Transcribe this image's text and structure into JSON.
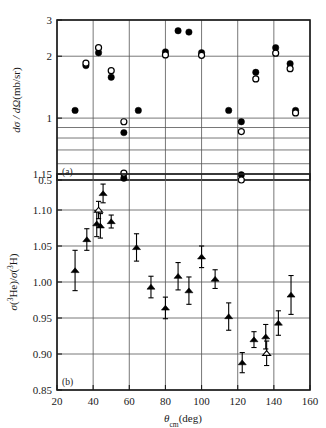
{
  "figure": {
    "background": "#ffffff",
    "ink": "#1a1a1a"
  },
  "chart_data": [
    {
      "type": "scatter",
      "panel_label": "(a)",
      "title": "",
      "xlabel": "",
      "ylabel": "dσ / dΩ(mb/sr)",
      "yscale": "log",
      "ylim": [
        0.5,
        3
      ],
      "xlim": [
        20,
        160
      ],
      "ytick_labels": [
        "3",
        "2",
        "1",
        "0.5"
      ],
      "ytick_values": [
        3,
        2,
        1,
        0.5
      ],
      "ygrid_values": [
        3,
        2,
        1,
        0.9,
        0.8,
        0.7,
        0.6,
        0.5
      ],
      "xgrid_values": [
        20,
        40,
        60,
        80,
        100,
        120,
        140,
        160
      ],
      "grid": true,
      "legend": "",
      "series": [
        {
          "name": "σ(3He) filled circles",
          "marker": "filled-circle",
          "points": [
            {
              "x": 30,
              "y": 1.09
            },
            {
              "x": 36,
              "y": 1.8
            },
            {
              "x": 43,
              "y": 2.08
            },
            {
              "x": 50,
              "y": 1.58
            },
            {
              "x": 57,
              "y": 0.85
            },
            {
              "x": 57,
              "y": 0.51
            },
            {
              "x": 65,
              "y": 1.09
            },
            {
              "x": 80,
              "y": 2.1
            },
            {
              "x": 87,
              "y": 2.66
            },
            {
              "x": 93,
              "y": 2.62
            },
            {
              "x": 100,
              "y": 2.08
            },
            {
              "x": 115,
              "y": 1.09
            },
            {
              "x": 122,
              "y": 0.96
            },
            {
              "x": 122,
              "y": 0.53
            },
            {
              "x": 130,
              "y": 1.67
            },
            {
              "x": 141,
              "y": 2.2
            },
            {
              "x": 149,
              "y": 1.84
            },
            {
              "x": 152,
              "y": 1.09
            }
          ]
        },
        {
          "name": "σ(3H) open circles",
          "marker": "open-circle",
          "points": [
            {
              "x": 36,
              "y": 1.85
            },
            {
              "x": 43,
              "y": 2.2
            },
            {
              "x": 50,
              "y": 1.7
            },
            {
              "x": 57,
              "y": 0.96
            },
            {
              "x": 57,
              "y": 0.54
            },
            {
              "x": 80,
              "y": 2.03
            },
            {
              "x": 100,
              "y": 2.02
            },
            {
              "x": 122,
              "y": 0.86
            },
            {
              "x": 122,
              "y": 0.5
            },
            {
              "x": 130,
              "y": 1.55
            },
            {
              "x": 141,
              "y": 2.07
            },
            {
              "x": 149,
              "y": 1.74
            },
            {
              "x": 152,
              "y": 1.06
            }
          ]
        }
      ]
    },
    {
      "type": "scatter",
      "panel_label": "(b)",
      "title": "",
      "xlabel": "θ_cm(deg)",
      "xlabel_parts": {
        "symbol": "θ",
        "subscript": "cm",
        "unit": "(deg)"
      },
      "ylabel": "σ(³He)/σ(³H)",
      "yscale": "linear",
      "ylim": [
        0.85,
        1.15
      ],
      "xlim": [
        20,
        160
      ],
      "ytick_labels": [
        "1.15",
        "1.10",
        "1.05",
        "1.00",
        "0.95",
        "0.90",
        "0.85"
      ],
      "ytick_values": [
        1.15,
        1.1,
        1.05,
        1.0,
        0.95,
        0.9,
        0.85
      ],
      "xtick_labels": [
        "20",
        "40",
        "60",
        "80",
        "100",
        "120",
        "140",
        "160"
      ],
      "xtick_values": [
        20,
        40,
        60,
        80,
        100,
        120,
        140,
        160
      ],
      "grid": true,
      "legend": "",
      "series": [
        {
          "name": "ratio filled triangles",
          "marker": "filled-triangle",
          "points": [
            {
              "x": 30,
              "y": 1.016,
              "err": 0.028
            },
            {
              "x": 36.5,
              "y": 1.059,
              "err": 0.015
            },
            {
              "x": 42,
              "y": 1.081,
              "err": 0.018
            },
            {
              "x": 44,
              "y": 1.078,
              "err": 0.017
            },
            {
              "x": 45.5,
              "y": 1.123,
              "err": 0.013
            },
            {
              "x": 50,
              "y": 1.084,
              "err": 0.009
            },
            {
              "x": 64,
              "y": 1.048,
              "err": 0.019
            },
            {
              "x": 72,
              "y": 0.993,
              "err": 0.015
            },
            {
              "x": 80,
              "y": 0.964,
              "err": 0.015
            },
            {
              "x": 87,
              "y": 1.008,
              "err": 0.019
            },
            {
              "x": 93,
              "y": 0.988,
              "err": 0.019
            },
            {
              "x": 100,
              "y": 1.035,
              "err": 0.015
            },
            {
              "x": 107.5,
              "y": 1.004,
              "err": 0.013
            },
            {
              "x": 115,
              "y": 0.952,
              "err": 0.019
            },
            {
              "x": 122.5,
              "y": 0.888,
              "err": 0.014
            },
            {
              "x": 129,
              "y": 0.92,
              "err": 0.011
            },
            {
              "x": 135.5,
              "y": 0.924,
              "err": 0.017
            },
            {
              "x": 142.5,
              "y": 0.943,
              "err": 0.017
            },
            {
              "x": 149.5,
              "y": 0.982,
              "err": 0.027
            }
          ]
        },
        {
          "name": "ratio open triangles",
          "marker": "open-triangle",
          "points": [
            {
              "x": 43,
              "y": 1.1,
              "err": 0.012
            },
            {
              "x": 136,
              "y": 0.901,
              "err": 0.017
            }
          ]
        }
      ]
    }
  ]
}
